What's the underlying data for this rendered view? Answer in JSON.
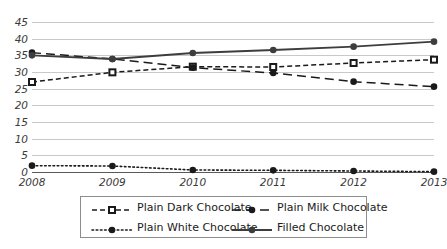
{
  "chart_data": {
    "type": "line",
    "title": "",
    "subtitle": "",
    "xlabel": "",
    "ylabel": "",
    "categories": [
      "2008",
      "2009",
      "2010",
      "2011",
      "2012",
      "2013"
    ],
    "ylim": [
      0,
      45
    ],
    "ytick_values": [
      0,
      5,
      10,
      15,
      20,
      25,
      30,
      35,
      40,
      45
    ],
    "ytick_labels": [
      "0",
      "5",
      "10",
      "15",
      "20",
      "25",
      "30",
      "35",
      "40",
      "45"
    ],
    "grid": true,
    "legend_position": "bottom",
    "series": [
      {
        "name": "Plain Dark Chocolate",
        "values": [
          27.0,
          29.9,
          31.6,
          31.5,
          32.7,
          33.7
        ],
        "color": "#1a1a1a",
        "line_style": "dashed",
        "marker": "square"
      },
      {
        "name": "Plain Milk Chocolate",
        "values": [
          35.8,
          33.9,
          31.3,
          29.7,
          27.1,
          25.6
        ],
        "color": "#1a1a1a",
        "line_style": "long-dashed",
        "marker": "circle"
      },
      {
        "name": "Plain White Chocolate",
        "values": [
          1.9,
          1.8,
          0.6,
          0.5,
          0.3,
          0.1
        ],
        "color": "#1a1a1a",
        "line_style": "dotted",
        "marker": "circle"
      },
      {
        "name": "Filled Chocolate",
        "values": [
          35.0,
          33.9,
          35.7,
          36.6,
          37.6,
          39.1
        ],
        "color": "#3d3d3d",
        "line_style": "solid",
        "marker": "circle"
      }
    ]
  },
  "legend": {
    "items": [
      {
        "label": "Plain Dark Chocolate"
      },
      {
        "label": "Plain Milk Chocolate"
      },
      {
        "label": "Plain White Chocolate"
      },
      {
        "label": "Filled Chocolate"
      }
    ]
  },
  "colors": {
    "grid": "#c9c9c9",
    "axis": "#5a5a5a",
    "text": "#3a3a3a",
    "series_dark": "#1a1a1a",
    "series_filled": "#3d3d3d",
    "legend_border": "#8d8d8d",
    "background": "#ffffff"
  }
}
